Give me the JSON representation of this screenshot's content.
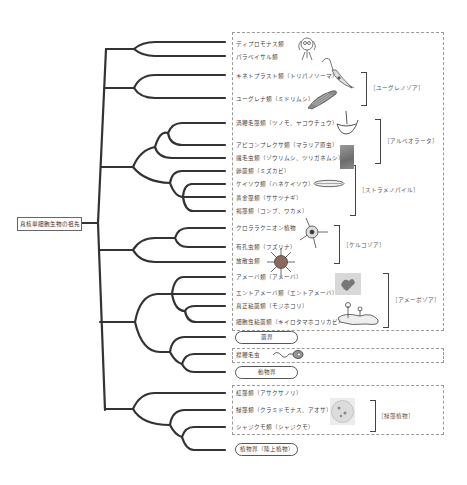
{
  "root": {
    "label": "真核単細胞生物の祖先"
  },
  "leaves": [
    {
      "label": "ディプロモナス類",
      "y": 44
    },
    {
      "label": "パラベイサル類",
      "y": 57
    },
    {
      "label": "キネトプラスト類（トリパノソーマ）",
      "y": 76
    },
    {
      "label": "ユーグレナ類（ミドリムシ）",
      "y": 98
    },
    {
      "label": "渦鞭毛藻類（ツノモ、ヤコウチュウ）",
      "y": 123
    },
    {
      "label": "アピコンプレクサ類（マラリア原虫）",
      "y": 144
    },
    {
      "label": "繊毛虫類（ゾウリムシ、ツリガネムシ）",
      "y": 158
    },
    {
      "label": "卵菌類（ミズカビ）",
      "y": 171
    },
    {
      "label": "ケイソウ類（ハネケイソウ）",
      "y": 183
    },
    {
      "label": "黄金藻類（ササツナギ）",
      "y": 198
    },
    {
      "label": "褐藻類（コンブ、ワカメ）",
      "y": 211
    },
    {
      "label": "クロララクニオン植物",
      "y": 228
    },
    {
      "label": "有孔虫類（フズリナ）",
      "y": 246
    },
    {
      "label": "放散虫類",
      "y": 261
    },
    {
      "label": "アメーバ類（アメーバ）",
      "y": 276
    },
    {
      "label": "エントアメーバ類（エントアメーバ）",
      "y": 293
    },
    {
      "label": "真正粘菌類（モジホコリ）",
      "y": 306
    },
    {
      "label": "細胞性粘菌類（キイロタマホコリカビ）",
      "y": 322
    },
    {
      "label": "襟鞭毛虫",
      "y": 354
    },
    {
      "label": "紅藻類（アサクサノリ）",
      "y": 392
    },
    {
      "label": "緑藻類（クラミドモナス、アオサ）",
      "y": 409
    },
    {
      "label": "シャジクモ類（シャジクモ）",
      "y": 426
    }
  ],
  "pills": [
    {
      "label": "菌界",
      "y": 335
    },
    {
      "label": "動物界",
      "y": 370
    },
    {
      "label": "植物界（陸上植物）",
      "y": 444
    }
  ],
  "groups": [
    {
      "label": "［ユーグレノゾア］",
      "top": 72,
      "height": 32,
      "bracket_x": 361,
      "label_x": 373
    },
    {
      "label": "［アルベオラータ］",
      "top": 119,
      "height": 43,
      "bracket_x": 373,
      "label_x": 382
    },
    {
      "label": "［ストラメノパイル］",
      "top": 165,
      "height": 49,
      "bracket_x": 350,
      "label_x": 359
    },
    {
      "label": "［ケルコゾア］",
      "top": 225,
      "height": 37,
      "bracket_x": 334,
      "label_x": 343
    },
    {
      "label": "［アメーボゾア］",
      "top": 273,
      "height": 53,
      "bracket_x": 383,
      "label_x": 392
    },
    {
      "label": "［緑藻植物］",
      "top": 400,
      "height": 30,
      "bracket_x": 370,
      "label_x": 378
    }
  ],
  "illustrations": [
    {
      "name": "diplomonad-illustration"
    },
    {
      "name": "trypanosoma-illustration"
    },
    {
      "name": "euglena-illustration"
    },
    {
      "name": "ceratium-illustration"
    },
    {
      "name": "ciliate-photo"
    },
    {
      "name": "diatom-illustration"
    },
    {
      "name": "chlorarachniophyte-illustration"
    },
    {
      "name": "radiolarian-illustration"
    },
    {
      "name": "amoeba-photo"
    },
    {
      "name": "slime-mold-illustration"
    },
    {
      "name": "choanoflagellate-illustration"
    },
    {
      "name": "green-alga-photo"
    }
  ],
  "colors": {
    "branch": "#333333",
    "dash": "#9a9a9a",
    "text": "#444444"
  }
}
